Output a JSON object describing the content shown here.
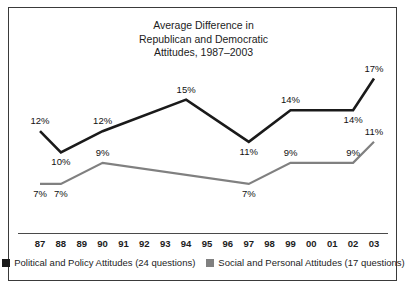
{
  "chart_data": {
    "type": "line",
    "title": "Average Difference in\nRepublican and Democratic\nAttitudes, 1987–2003",
    "xlabel": "",
    "ylabel": "",
    "grid": false,
    "legend_position": "bottom",
    "ylim": [
      5,
      18
    ],
    "categories": [
      "87",
      "88",
      "89",
      "90",
      "91",
      "92",
      "93",
      "94",
      "95",
      "96",
      "97",
      "98",
      "99",
      "00",
      "01",
      "02",
      "03"
    ],
    "series": [
      {
        "name": "Political and Policy Attitudes (24 questions)",
        "color": "#1a1a1a",
        "points": [
          {
            "x": "87",
            "value": 12,
            "label": "12%"
          },
          {
            "x": "88",
            "value": 10,
            "label": "10%"
          },
          {
            "x": "90",
            "value": 12,
            "label": "12%"
          },
          {
            "x": "94",
            "value": 15,
            "label": "15%"
          },
          {
            "x": "97",
            "value": 11,
            "label": "11%"
          },
          {
            "x": "99",
            "value": 14,
            "label": "14%"
          },
          {
            "x": "02",
            "value": 14,
            "label": "14%"
          },
          {
            "x": "03",
            "value": 17,
            "label": "17%"
          }
        ]
      },
      {
        "name": "Social and Personal Attitudes (17 questions)",
        "color": "#808080",
        "points": [
          {
            "x": "87",
            "value": 7,
            "label": "7%"
          },
          {
            "x": "88",
            "value": 7,
            "label": "7%"
          },
          {
            "x": "90",
            "value": 9,
            "label": "9%"
          },
          {
            "x": "97",
            "value": 7,
            "label": "7%"
          },
          {
            "x": "99",
            "value": 9,
            "label": "9%"
          },
          {
            "x": "02",
            "value": 9,
            "label": "9%"
          },
          {
            "x": "03",
            "value": 11,
            "label": "11%"
          }
        ]
      }
    ]
  },
  "chart": {
    "title": "Average Difference in\nRepublican and Democratic\nAttitudes, 1987–2003"
  },
  "legend": {
    "items": [
      {
        "label": "Political and Policy Attitudes (24 questions)",
        "color": "#1a1a1a"
      },
      {
        "label": "Social and Personal Attitudes (17 questions)",
        "color": "#808080"
      }
    ]
  },
  "colors": {
    "series_dark": "#1a1a1a",
    "series_gray": "#808080",
    "frame": "#3a3a3a",
    "text": "#1c1c1c",
    "background": "#ffffff"
  }
}
